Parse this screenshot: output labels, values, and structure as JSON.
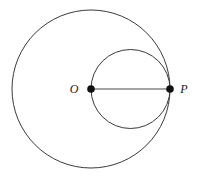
{
  "figure": {
    "type": "geometry-diagram",
    "width": 197,
    "height": 177,
    "background_color": "#ffffff",
    "stroke_color": "#3a3a3a",
    "point_color": "#111111",
    "labels": {
      "center_point": "O",
      "boundary_point": "P"
    },
    "points": [
      {
        "name": "O",
        "label": "O",
        "x": 91,
        "y": 89,
        "radius": 3.8
      },
      {
        "name": "P",
        "label": "P",
        "x": 170,
        "y": 89,
        "radius": 3.8
      }
    ],
    "circles": [
      {
        "name": "large-circle",
        "cx": 91,
        "cy": 89,
        "r": 79
      },
      {
        "name": "small-circle",
        "cx": 130.5,
        "cy": 89,
        "r": 39.5
      }
    ],
    "segments": [
      {
        "name": "segment-OP",
        "x1": 91,
        "y1": 89,
        "x2": 170,
        "y2": 89
      }
    ]
  }
}
